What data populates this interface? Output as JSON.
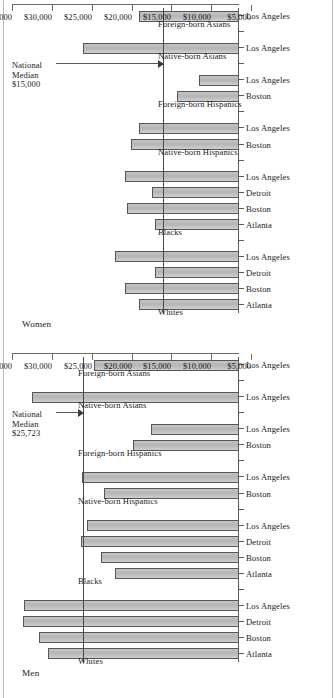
{
  "figure": {
    "axis_min": 5000,
    "axis_max": 35000,
    "tick_labels": [
      "$5,000",
      "$10,000",
      "$15,000",
      "$20,000",
      "$25,000",
      "$30,000",
      "$35,000"
    ],
    "tick_values": [
      5000,
      10000,
      15000,
      20000,
      25000,
      30000,
      35000
    ]
  },
  "panels": [
    {
      "key": "women",
      "title": "Women",
      "median_label": "National\nMedian\n$15,000",
      "median_value": 15000
    },
    {
      "key": "men",
      "title": "Men",
      "median_label": "National\nMedian\n$25,723",
      "median_value": 25723
    }
  ],
  "chart_data": [
    {
      "type": "bar",
      "title": "Women",
      "orientation": "vertical-rotated",
      "xlabel": "",
      "ylabel": "",
      "ylim": [
        5000,
        35000
      ],
      "grid": false,
      "legend": "none",
      "reference_line": {
        "label": "National Median $15,000",
        "value": 15000
      },
      "groups": [
        {
          "name": "Whites",
          "categories": [
            "Atlanta",
            "Boston",
            "Detroit",
            "Los Angeles"
          ],
          "values": [
            18400,
            20200,
            16200,
            21500
          ]
        },
        {
          "name": "Blacks",
          "categories": [
            "Atlanta",
            "Boston",
            "Detroit",
            "Los Angeles"
          ],
          "values": [
            16200,
            20000,
            16600,
            20200
          ]
        },
        {
          "name": "Native-born Hispanics",
          "categories": [
            "Boston",
            "Los Angeles"
          ],
          "values": [
            19400,
            18400
          ]
        },
        {
          "name": "Foreign-born Hispanics",
          "categories": [
            "Boston",
            "Los Angeles"
          ],
          "values": [
            13300,
            10400
          ]
        },
        {
          "name": "Native-born Asians",
          "categories": [
            "Los Angeles"
          ],
          "values": [
            25800
          ]
        },
        {
          "name": "Foreign-born Asians",
          "categories": [
            "Los Angeles"
          ],
          "values": [
            18300
          ]
        }
      ],
      "categories": [
        "Atlanta",
        "Boston",
        "Detroit",
        "Los Angeles",
        "Atlanta",
        "Boston",
        "Detroit",
        "Los Angeles",
        "Boston",
        "Los Angeles",
        "Boston",
        "Los Angeles",
        "Los Angeles",
        "Los Angeles"
      ],
      "values": [
        18400,
        20200,
        16200,
        21500,
        16200,
        20000,
        16600,
        20200,
        19400,
        18400,
        13300,
        10400,
        25800,
        18300
      ]
    },
    {
      "type": "bar",
      "title": "Men",
      "orientation": "vertical-rotated",
      "xlabel": "",
      "ylabel": "",
      "ylim": [
        5000,
        35000
      ],
      "grid": false,
      "legend": "none",
      "reference_line": {
        "label": "National Median $25,723",
        "value": 25723
      },
      "groups": [
        {
          "name": "Whites",
          "categories": [
            "Atlanta",
            "Boston",
            "Detroit",
            "Los Angeles"
          ],
          "values": [
            30500,
            31700,
            33800,
            33700
          ]
        },
        {
          "name": "Blacks",
          "categories": [
            "Atlanta",
            "Boston",
            "Detroit",
            "Los Angeles"
          ],
          "values": [
            21600,
            23400,
            26100,
            25300
          ]
        },
        {
          "name": "Native-born Hispanics",
          "categories": [
            "Boston",
            "Los Angeles"
          ],
          "values": [
            23000,
            26000
          ]
        },
        {
          "name": "Foreign-born Hispanics",
          "categories": [
            "Boston",
            "Los Angeles"
          ],
          "values": [
            19200,
            16800
          ]
        },
        {
          "name": "Native-born Asians",
          "categories": [
            "Los Angeles"
          ],
          "values": [
            32600
          ]
        },
        {
          "name": "Foreign-born Asians",
          "categories": [
            "Los Angeles"
          ],
          "values": [
            24300
          ]
        }
      ],
      "categories": [
        "Atlanta",
        "Boston",
        "Detroit",
        "Los Angeles",
        "Atlanta",
        "Boston",
        "Detroit",
        "Los Angeles",
        "Boston",
        "Los Angeles",
        "Boston",
        "Los Angeles",
        "Los Angeles",
        "Los Angeles"
      ],
      "values": [
        30500,
        31700,
        33800,
        33700,
        21600,
        23400,
        26100,
        25300,
        23000,
        26000,
        19200,
        16800,
        32600,
        24300
      ]
    }
  ]
}
